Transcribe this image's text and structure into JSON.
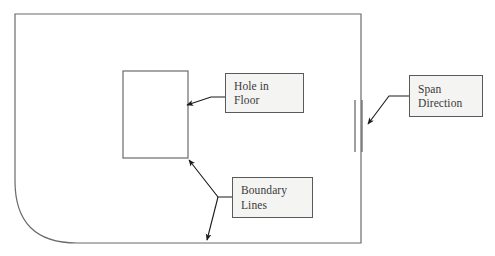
{
  "diagram": {
    "colors": {
      "outline": "#6b6b6b",
      "box_border": "#5a5a5a",
      "box_fill": "#f4f4f2",
      "arrow": "#1a1a1a",
      "text": "#3a3a3a",
      "background": "#ffffff"
    },
    "shapes": {
      "floor_outline": {
        "name": "floor-slab-outline",
        "description": "Large rectangle with rounded bottom-left corner",
        "x": 15,
        "y": 14,
        "width": 346,
        "height": 229,
        "corner_radius": 62
      },
      "hole": {
        "name": "hole-in-floor-opening",
        "description": "Rectangular opening inside the floor slab",
        "x": 123,
        "y": 71,
        "width": 65,
        "height": 87
      },
      "span_marker": {
        "name": "span-direction-marker",
        "description": "Pair of short parallel vertical lines",
        "line_count": 2,
        "x1": 355,
        "x2": 362,
        "y_top": 100,
        "y_bottom": 152
      }
    },
    "callouts": [
      {
        "id": "hole-in-floor",
        "lines": [
          "Hole in",
          "Floor"
        ],
        "target": "hole-in-floor-opening"
      },
      {
        "id": "boundary-lines",
        "lines": [
          "Boundary",
          "Lines"
        ],
        "target": "floor-slab-outline"
      },
      {
        "id": "span-direction",
        "lines": [
          "Span",
          "Direction"
        ],
        "target": "span-direction-marker"
      }
    ],
    "leaders": [
      {
        "name": "leader-hole-in-floor",
        "from": [
          225,
          97
        ],
        "to": [
          187,
          105
        ],
        "arrowheads": 1
      },
      {
        "name": "leader-boundary-lines-upper",
        "from": [
          232,
          197
        ],
        "to": [
          188,
          159
        ],
        "arrowheads": 1
      },
      {
        "name": "leader-boundary-lines-lower",
        "from": [
          232,
          197
        ],
        "to": [
          207,
          241
        ],
        "arrowheads": 1
      },
      {
        "name": "leader-span-direction",
        "from": [
          409,
          96
        ],
        "to": [
          367,
          125
        ],
        "arrowheads": 1
      }
    ]
  }
}
